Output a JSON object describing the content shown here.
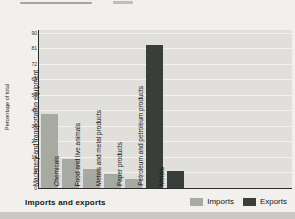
{
  "chart_data": {
    "type": "bar",
    "title": "Imports and exports",
    "ylabel": "Percentage of total",
    "ylim": [
      0,
      90
    ],
    "yticks": [
      90,
      81,
      72,
      63,
      54,
      45,
      36,
      27,
      18,
      9,
      0
    ],
    "grid": true,
    "legend_position": "bottom-right",
    "categories": [
      "Machinery and transportation equipment",
      "Chemicals",
      "Food and live animals",
      "Metals and metal products",
      "Paper products",
      "Petroleum and petroleum products",
      "Metals"
    ],
    "values": [
      43,
      17,
      11,
      8,
      5,
      83,
      10
    ],
    "bar_series": [
      "Imports",
      "Imports",
      "Imports",
      "Imports",
      "Imports",
      "Exports",
      "Exports"
    ],
    "legend": [
      {
        "label": "Imports",
        "color": "#a6aaa0"
      },
      {
        "label": "Exports",
        "color": "#3a3e3a"
      }
    ],
    "colors": {
      "imports_bar": "#a6aaa0",
      "exports_bar": "#3a3e3a",
      "plot_background": "#e0dfdb",
      "gridline": "#f3f2ee",
      "axis": "#2b2b2b",
      "page_background": "#f1f0ec",
      "bottom_strip": "#c9c8c4"
    }
  }
}
